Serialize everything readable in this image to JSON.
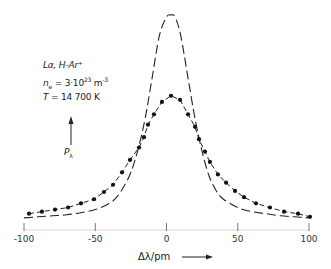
{
  "chart_data": {
    "type": "line",
    "title": "",
    "xlabel": "Δλ/pm",
    "ylabel": "P_λ",
    "xlim": [
      -100,
      100
    ],
    "ylim": [
      0,
      1.0
    ],
    "grid": false,
    "x_ticks": [
      -100,
      -50,
      0,
      50,
      100
    ],
    "x_tick_labels": [
      "-100",
      "-50",
      "0",
      "50",
      "100"
    ],
    "annotations": {
      "line": "Lα, H-Ar⁺",
      "ne_prefix": "n",
      "ne_sub": "e",
      "ne_value": " = 3·10",
      "ne_exp": "23",
      "ne_unit": " m",
      "ne_unit_exp": "-3",
      "temp_label": "T",
      "temp_value": " = 14 700 K",
      "ylabel_main": "P",
      "ylabel_sub": "λ"
    },
    "series": [
      {
        "name": "measured (dots)",
        "style": "dashed-with-markers",
        "x": [
          -96.5,
          -87.4,
          -78.2,
          -69.1,
          -60,
          -50.9,
          -43.9,
          -37.5,
          -31.2,
          -25.6,
          -19.3,
          -15.8,
          -13,
          -8.8,
          -3.2,
          3.2,
          9.5,
          15.1,
          20,
          22.8,
          27,
          30.5,
          36.1,
          41.8,
          48.1,
          54.4,
          62.8,
          72.6,
          82.5,
          92.3,
          100.7
        ],
        "y": [
          0.04,
          0.05,
          0.06,
          0.07,
          0.09,
          0.11,
          0.145,
          0.18,
          0.24,
          0.3,
          0.36,
          0.41,
          0.47,
          0.52,
          0.58,
          0.61,
          0.59,
          0.52,
          0.46,
          0.4,
          0.34,
          0.29,
          0.23,
          0.19,
          0.15,
          0.12,
          0.09,
          0.07,
          0.05,
          0.04,
          0.025
        ]
      },
      {
        "name": "calculated (dashed)",
        "style": "dashed",
        "x": [
          -100,
          -90,
          -80,
          -70,
          -60,
          -50,
          -40,
          -35,
          -30,
          -25,
          -20,
          -15,
          -10,
          -5,
          0,
          3,
          6,
          10,
          15,
          20,
          25,
          30,
          35,
          40,
          50,
          60,
          70,
          80,
          90,
          100
        ],
        "y": [
          0.02,
          0.025,
          0.03,
          0.035,
          0.045,
          0.06,
          0.09,
          0.12,
          0.17,
          0.24,
          0.35,
          0.5,
          0.7,
          0.9,
          0.99,
          1.0,
          0.99,
          0.9,
          0.7,
          0.5,
          0.34,
          0.22,
          0.15,
          0.11,
          0.07,
          0.05,
          0.04,
          0.03,
          0.025,
          0.02
        ]
      }
    ]
  }
}
